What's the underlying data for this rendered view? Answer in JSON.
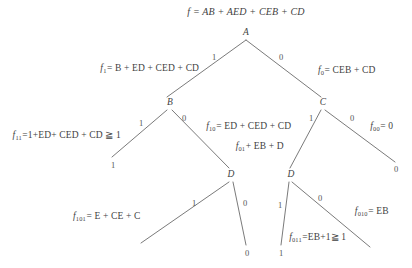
{
  "diagram": {
    "line_color": "#6b6b6b",
    "text_color": "#3f3f3f",
    "background": "#ffffff"
  },
  "root_formula": {
    "lhs": "f",
    "eq": "=",
    "rhs": "AB + AED + CEB + CD",
    "full": "f = AB + AED + CEB + CD"
  },
  "nodes": [
    {
      "id": "A",
      "label": "A",
      "x": 246,
      "y": 33
    },
    {
      "id": "B",
      "label": "B",
      "x": 170,
      "y": 103
    },
    {
      "id": "C",
      "label": "C",
      "x": 323,
      "y": 103
    },
    {
      "id": "D1",
      "label": "D",
      "x": 231,
      "y": 175
    },
    {
      "id": "D2",
      "label": "D",
      "x": 291,
      "y": 175
    }
  ],
  "branch_labels": [
    {
      "id": "A-left",
      "text": "1",
      "x": 214,
      "y": 57
    },
    {
      "id": "A-right",
      "text": "0",
      "x": 281,
      "y": 57
    },
    {
      "id": "B-left",
      "text": "1",
      "x": 141,
      "y": 123
    },
    {
      "id": "B-right",
      "text": "0",
      "x": 184,
      "y": 118
    },
    {
      "id": "C-left",
      "text": "1",
      "x": 311,
      "y": 118
    },
    {
      "id": "C-right",
      "text": "0",
      "x": 352,
      "y": 118
    },
    {
      "id": "D1-left",
      "text": "1",
      "x": 194,
      "y": 203
    },
    {
      "id": "D1-right",
      "text": "0",
      "x": 245,
      "y": 203
    },
    {
      "id": "D2-left",
      "text": "1",
      "x": 280,
      "y": 205
    },
    {
      "id": "D2-right",
      "text": "0",
      "x": 320,
      "y": 198
    }
  ],
  "terminals": [
    {
      "id": "t-11",
      "text": "1",
      "x": 113,
      "y": 165
    },
    {
      "id": "t-00",
      "text": "0",
      "x": 396,
      "y": 169
    },
    {
      "id": "t-100",
      "text": "0",
      "x": 247,
      "y": 253
    },
    {
      "id": "t-011",
      "text": "1",
      "x": 281,
      "y": 253
    }
  ],
  "formulas": [
    {
      "id": "f1",
      "sub": "1",
      "body": "= B + ED + CED + CD",
      "x": 150,
      "y": 69,
      "anchor": "center"
    },
    {
      "id": "f0",
      "sub": "0",
      "body": "= CEB + CD",
      "x": 347,
      "y": 71,
      "anchor": "center"
    },
    {
      "id": "f11",
      "sub": "11",
      "body": "=1+ED+ CED + CD ≧ 1",
      "x": 67,
      "y": 136,
      "anchor": "center"
    },
    {
      "id": "f10",
      "sub": "10",
      "body": "= ED + CED + CD",
      "x": 249,
      "y": 127,
      "anchor": "center"
    },
    {
      "id": "f00",
      "sub": "00",
      "body": "= 0",
      "x": 382,
      "y": 127,
      "anchor": "center"
    },
    {
      "id": "f01",
      "sub": "01",
      "body": "+ EB + D",
      "x": 260,
      "y": 147,
      "anchor": "center"
    },
    {
      "id": "f101",
      "sub": "101",
      "body": "= E + CE + C",
      "x": 107,
      "y": 217,
      "anchor": "center"
    },
    {
      "id": "f011",
      "sub": "011",
      "body": "=EB+1≧ 1",
      "x": 318,
      "y": 238,
      "anchor": "center"
    },
    {
      "id": "f010",
      "sub": "010",
      "body": "= EB",
      "x": 372,
      "y": 212,
      "anchor": "center"
    }
  ],
  "edges": [
    {
      "id": "A-to-B",
      "x1": 246,
      "y1": 40,
      "x2": 167,
      "y2": 97
    },
    {
      "id": "A-to-C",
      "x1": 246,
      "y1": 40,
      "x2": 321,
      "y2": 97
    },
    {
      "id": "B-to-one",
      "x1": 167,
      "y1": 110,
      "x2": 112,
      "y2": 157
    },
    {
      "id": "B-to-D1",
      "x1": 172,
      "y1": 110,
      "x2": 229,
      "y2": 168
    },
    {
      "id": "C-to-D2",
      "x1": 321,
      "y1": 110,
      "x2": 290,
      "y2": 168
    },
    {
      "id": "C-to-zero",
      "x1": 325,
      "y1": 110,
      "x2": 395,
      "y2": 162
    },
    {
      "id": "D1-to-left",
      "x1": 229,
      "y1": 182,
      "x2": 141,
      "y2": 243
    },
    {
      "id": "D1-to-zero",
      "x1": 233,
      "y1": 182,
      "x2": 246,
      "y2": 245
    },
    {
      "id": "D2-to-one",
      "x1": 289,
      "y1": 182,
      "x2": 281,
      "y2": 245
    },
    {
      "id": "D2-to-right",
      "x1": 292,
      "y1": 182,
      "x2": 370,
      "y2": 247
    }
  ]
}
